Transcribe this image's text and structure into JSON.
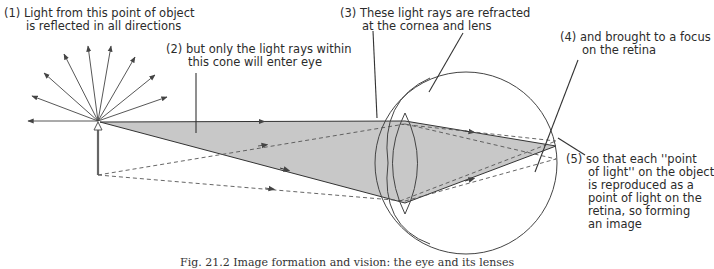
{
  "figure": {
    "labels": {
      "l1": {
        "num": "(1)",
        "line1": "Light from this point of object",
        "line2": "is reflected in all directions"
      },
      "l2": {
        "num": "(2)",
        "line1": "but only the light rays within",
        "line2": "this cone will enter eye"
      },
      "l3": {
        "num": "(3)",
        "line1": "These light rays are refracted",
        "line2": "at the cornea and lens"
      },
      "l4": {
        "num": "(4)",
        "line1": "and brought to a focus",
        "line2": "on the retina"
      },
      "l5": {
        "num": "(5)",
        "line1": "so that each ''point",
        "line2": "of light'' on the object",
        "line3": "is reproduced as a",
        "line4": "point of light on the",
        "line5": "retina, so forming",
        "line6": "an image"
      }
    },
    "caption": "Fig. 21.2   Image formation and vision: the eye and its lenses",
    "colors": {
      "cone_fill": "#c8c8c8",
      "line": "#3a3a3a",
      "dashed": "#555555"
    }
  }
}
